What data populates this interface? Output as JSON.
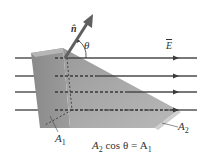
{
  "diagram": {
    "labels": {
      "normal_vector": "n̂",
      "angle": "θ",
      "field": "E",
      "area_1": "A",
      "area_1_sub": "1",
      "area_2": "A",
      "area_2_sub": "2",
      "equation_a": "A",
      "equation_a_sub": "2",
      "equation_mid": " cos θ = A",
      "equation_end_sub": "1"
    },
    "colors": {
      "field_lines": "#4a4a4a",
      "normal_vector": "#5f5f5f",
      "prism_left": "#8f8f8f",
      "prism_top": "#b4b4b4",
      "prism_slope": "#a3a3a3",
      "prism_bottom": "#c4c4c4",
      "dashed": "#3a3a3a"
    },
    "field_lines_y": [
      58,
      76,
      92,
      110
    ]
  }
}
